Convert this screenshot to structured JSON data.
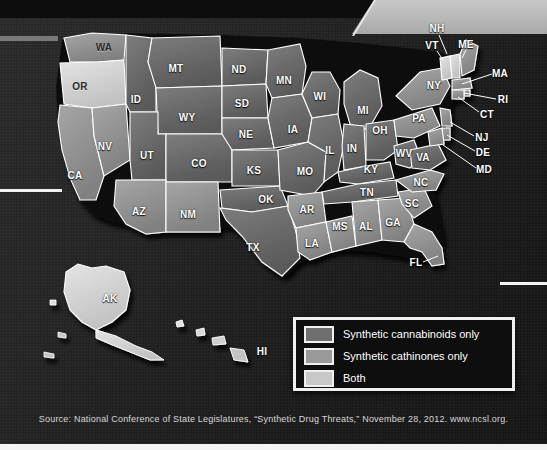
{
  "map": {
    "title": "U.S. state synthetic drug legislation map",
    "state_labels": [
      {
        "abbr": "WA",
        "x": 104,
        "y": 47,
        "dark": true
      },
      {
        "abbr": "OR",
        "x": 80,
        "y": 86,
        "dark": true
      },
      {
        "abbr": "CA",
        "x": 75,
        "y": 175,
        "dark": false
      },
      {
        "abbr": "NV",
        "x": 105,
        "y": 146,
        "dark": false
      },
      {
        "abbr": "ID",
        "x": 136,
        "y": 99,
        "dark": false
      },
      {
        "abbr": "MT",
        "x": 176,
        "y": 68,
        "dark": false
      },
      {
        "abbr": "WY",
        "x": 187,
        "y": 117,
        "dark": false
      },
      {
        "abbr": "UT",
        "x": 147,
        "y": 155,
        "dark": false
      },
      {
        "abbr": "CO",
        "x": 199,
        "y": 163,
        "dark": false
      },
      {
        "abbr": "AZ",
        "x": 139,
        "y": 211,
        "dark": false
      },
      {
        "abbr": "NM",
        "x": 188,
        "y": 214,
        "dark": false
      },
      {
        "abbr": "ND",
        "x": 239,
        "y": 69,
        "dark": false
      },
      {
        "abbr": "SD",
        "x": 242,
        "y": 103,
        "dark": false
      },
      {
        "abbr": "NE",
        "x": 246,
        "y": 134,
        "dark": false
      },
      {
        "abbr": "KS",
        "x": 254,
        "y": 170,
        "dark": false
      },
      {
        "abbr": "OK",
        "x": 266,
        "y": 199,
        "dark": false
      },
      {
        "abbr": "TX",
        "x": 253,
        "y": 247,
        "dark": false
      },
      {
        "abbr": "MN",
        "x": 284,
        "y": 80,
        "dark": false
      },
      {
        "abbr": "IA",
        "x": 293,
        "y": 129,
        "dark": false
      },
      {
        "abbr": "MO",
        "x": 305,
        "y": 171,
        "dark": false
      },
      {
        "abbr": "AR",
        "x": 307,
        "y": 209,
        "dark": false
      },
      {
        "abbr": "LA",
        "x": 312,
        "y": 243,
        "dark": false
      },
      {
        "abbr": "WI",
        "x": 320,
        "y": 96,
        "dark": false
      },
      {
        "abbr": "IL",
        "x": 330,
        "y": 150,
        "dark": false
      },
      {
        "abbr": "MS",
        "x": 340,
        "y": 226,
        "dark": false
      },
      {
        "abbr": "MI",
        "x": 363,
        "y": 110,
        "dark": false
      },
      {
        "abbr": "IN",
        "x": 352,
        "y": 148,
        "dark": false
      },
      {
        "abbr": "KY",
        "x": 371,
        "y": 169,
        "dark": false
      },
      {
        "abbr": "TN",
        "x": 367,
        "y": 192,
        "dark": false
      },
      {
        "abbr": "AL",
        "x": 366,
        "y": 226,
        "dark": false
      },
      {
        "abbr": "OH",
        "x": 380,
        "y": 130,
        "dark": false
      },
      {
        "abbr": "GA",
        "x": 393,
        "y": 222,
        "dark": false
      },
      {
        "abbr": "SC",
        "x": 412,
        "y": 203,
        "dark": false
      },
      {
        "abbr": "NC",
        "x": 421,
        "y": 182,
        "dark": false
      },
      {
        "abbr": "WV",
        "x": 404,
        "y": 153,
        "dark": false
      },
      {
        "abbr": "VA",
        "x": 423,
        "y": 157,
        "dark": false
      },
      {
        "abbr": "PA",
        "x": 419,
        "y": 118,
        "dark": false
      },
      {
        "abbr": "NY",
        "x": 434,
        "y": 85,
        "dark": false
      },
      {
        "abbr": "AK",
        "x": 110,
        "y": 298,
        "dark": false
      },
      {
        "abbr": "HI",
        "x": 262,
        "y": 351,
        "dark": false
      }
    ],
    "callout_labels": [
      {
        "abbr": "NH",
        "x": 437,
        "y": 28,
        "lx1": 439,
        "ly1": 35,
        "lx2": 447,
        "ly2": 54
      },
      {
        "abbr": "VT",
        "x": 432,
        "y": 45,
        "lx1": 437,
        "ly1": 51,
        "lx2": 443,
        "ly2": 60
      },
      {
        "abbr": "ME",
        "x": 466,
        "y": 44,
        "lx1": 466,
        "ly1": 50,
        "lx2": 462,
        "ly2": 58
      },
      {
        "abbr": "MA",
        "x": 500,
        "y": 73,
        "lx1": 492,
        "ly1": 74,
        "lx2": 462,
        "ly2": 84
      },
      {
        "abbr": "RI",
        "x": 503,
        "y": 99,
        "lx1": 496,
        "ly1": 99,
        "lx2": 464,
        "ly2": 93
      },
      {
        "abbr": "CT",
        "x": 487,
        "y": 114,
        "lx1": 479,
        "ly1": 112,
        "lx2": 458,
        "ly2": 97
      },
      {
        "abbr": "NJ",
        "x": 482,
        "y": 137,
        "lx1": 474,
        "ly1": 136,
        "lx2": 450,
        "ly2": 122
      },
      {
        "abbr": "DE",
        "x": 483,
        "y": 152,
        "lx1": 475,
        "ly1": 151,
        "lx2": 447,
        "ly2": 135
      },
      {
        "abbr": "MD",
        "x": 484,
        "y": 169,
        "lx1": 476,
        "ly1": 168,
        "lx2": 443,
        "ly2": 145
      },
      {
        "abbr": "FL",
        "x": 416,
        "y": 262,
        "lx1": 423,
        "ly1": 262,
        "lx2": 438,
        "ly2": 256
      }
    ]
  },
  "legend": {
    "items": [
      {
        "label": "Synthetic cannabinoids only",
        "color": "#6f6f6f"
      },
      {
        "label": "Synthetic cathinones only",
        "color": "#9a9a9a"
      },
      {
        "label": "Both",
        "color": "#c8c8c8"
      }
    ]
  },
  "source": {
    "text": "Source: National Conference of State Legislatures, “Synthetic Drug Threats,” November 28, 2012. www.ncsl.org."
  }
}
